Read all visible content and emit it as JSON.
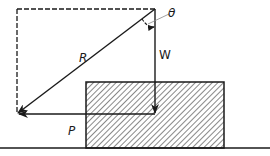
{
  "diagram": {
    "labels": {
      "resultant": "R",
      "angle": "θ",
      "weight": "W",
      "push": "P"
    },
    "colors": {
      "ink": "#1a1a1a",
      "hatch": "#555555",
      "background": "#ffffff"
    },
    "elements": {
      "resultant_vector": "R — diagonal arrow from top-right corner to bottom-left corner",
      "weight_vector": "W — vertical downward arrow",
      "push_vector": "P — horizontal leftward arrow",
      "angle_arc": "θ — angle between W and R",
      "block": "hatched rectangular block",
      "ground": "horizontal ground line",
      "construction_lines": "dashed parallelogram sides"
    }
  }
}
